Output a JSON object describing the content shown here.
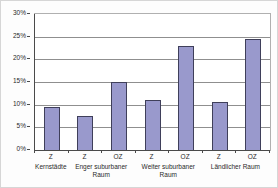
{
  "chart_data": {
    "type": "bar",
    "title": "",
    "categories": [
      "Z",
      "Z",
      "OZ",
      "Z",
      "OZ",
      "Z",
      "OZ"
    ],
    "values": [
      9.5,
      7.5,
      15,
      11,
      23,
      10.5,
      24.5
    ],
    "groups": [
      {
        "label": "Kernstädte",
        "span": 1
      },
      {
        "label": "Enger suburbaner Raum",
        "span": 2
      },
      {
        "label": "Weiter suburbaner Raum",
        "span": 2
      },
      {
        "label": "Ländlicher Raum",
        "span": 2
      }
    ],
    "xlabel": "",
    "ylabel": "",
    "ylim": [
      0,
      30
    ],
    "yticks": [
      {
        "label": "30%",
        "value": 30
      },
      {
        "label": "25%",
        "value": 25
      },
      {
        "label": "20%",
        "value": 20
      },
      {
        "label": "15%",
        "value": 15
      },
      {
        "label": "10%",
        "value": 10
      },
      {
        "label": "5%",
        "value": 5
      },
      {
        "label": "0%",
        "value": 0
      }
    ],
    "grid": true,
    "legend_position": "none",
    "bar_color": "#9999cc",
    "bar_border_color": "#3f3f5a",
    "grid_color": "#8f8f8f",
    "axis_color": "#4a4a4a",
    "plot_border_color": "#b0b0b0",
    "text_color": "#2a2a2a"
  }
}
